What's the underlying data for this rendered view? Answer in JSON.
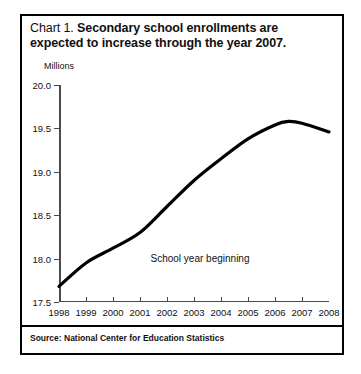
{
  "figure": {
    "title_lead": "Chart 1.",
    "title_main": "Secondary school enrollments are expected to increase through the year 2007.",
    "source": "Source: National Center for Education Statistics"
  },
  "chart_data": {
    "type": "line",
    "title": "Chart 1. Secondary school enrollments are expected to increase through the year 2007.",
    "xlabel": "School year beginning",
    "ylabel": "Millions",
    "ylim": [
      17.5,
      20.0
    ],
    "xlim": [
      1998,
      2008
    ],
    "yticks": [
      17.5,
      18.0,
      18.5,
      19.0,
      19.5,
      20.0
    ],
    "ytick_labels": [
      "17.5",
      "18.0",
      "18.5",
      "19.0",
      "19.5",
      "20.0"
    ],
    "xticks": [
      1998,
      1999,
      2000,
      2001,
      2002,
      2003,
      2004,
      2005,
      2006,
      2007,
      2008
    ],
    "xtick_labels": [
      "1998",
      "1999",
      "2000",
      "2001",
      "2002",
      "2003",
      "2004",
      "2005",
      "2006",
      "2007",
      "2008"
    ],
    "grid": false,
    "legend": null,
    "line_color": "#000000",
    "line_width": 3,
    "series": [
      {
        "name": "Secondary school enrollments",
        "x": [
          1998,
          1999,
          2000,
          2001,
          2002,
          2003,
          2004,
          2005,
          2006,
          2006.5,
          2007,
          2008
        ],
        "values": [
          17.68,
          17.95,
          18.12,
          18.3,
          18.6,
          18.9,
          19.15,
          19.38,
          19.54,
          19.58,
          19.56,
          19.46
        ]
      }
    ]
  }
}
